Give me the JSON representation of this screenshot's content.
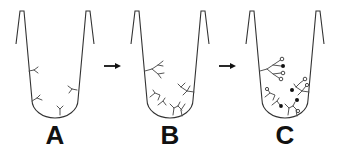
{
  "diagram": {
    "panels": [
      {
        "id": "A",
        "label": "A",
        "description": "Tube with a few single Y-shaped antibodies bound to walls"
      },
      {
        "id": "B",
        "label": "B",
        "description": "Tube with branched antibody structures"
      },
      {
        "id": "C",
        "label": "C",
        "description": "Tube with branched structures ending in filled and open circles"
      }
    ],
    "arrows": [
      {
        "from": "A",
        "to": "B"
      },
      {
        "from": "B",
        "to": "C"
      }
    ],
    "colors": {
      "line": "#333333",
      "structure": "#555555",
      "label": "#111111",
      "background": "#ffffff"
    }
  }
}
